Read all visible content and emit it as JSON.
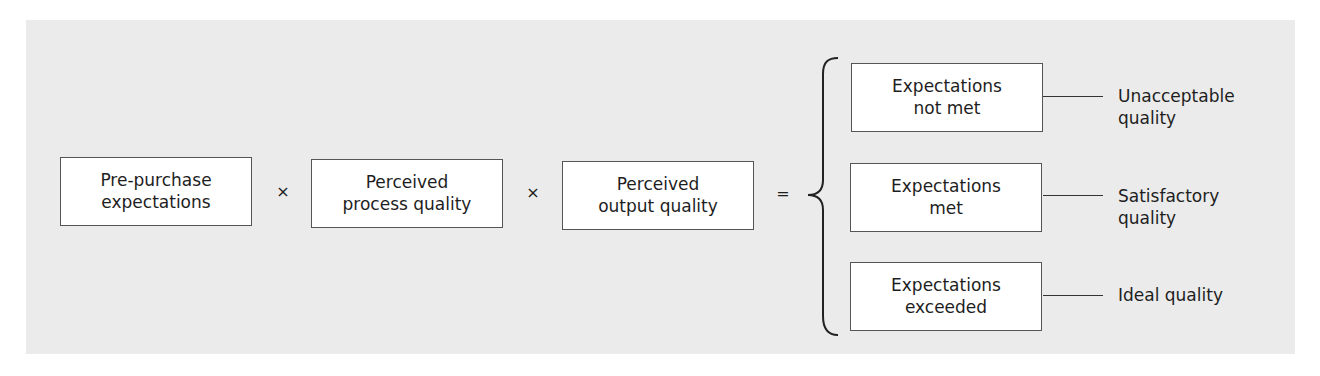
{
  "diagram": {
    "inputs": [
      {
        "label": "Pre-purchase\nexpectations"
      },
      {
        "label": "Perceived\nprocess quality"
      },
      {
        "label": "Perceived\noutput quality"
      }
    ],
    "operators": {
      "multiply_1": "×",
      "multiply_2": "×",
      "equals": "="
    },
    "outcomes": [
      {
        "state": "Expectations\nnot met",
        "quality": "Unacceptable\nquality"
      },
      {
        "state": "Expectations\nmet",
        "quality": "Satisfactory\nquality"
      },
      {
        "state": "Expectations\nexceeded",
        "quality": "Ideal quality"
      }
    ]
  },
  "colors": {
    "panel_background": "#ebebeb",
    "box_background": "#ffffff",
    "box_border": "#555555",
    "text": "#1e1e1e"
  }
}
